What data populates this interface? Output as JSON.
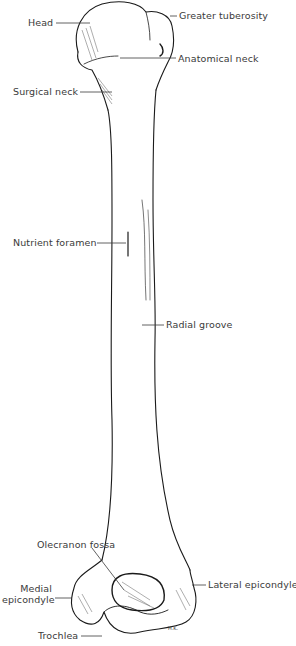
{
  "diagram": {
    "labels": {
      "head": "Head",
      "greater_tuberosity": "Greater tuberosity",
      "anatomical_neck": "Anatomical neck",
      "surgical_neck": "Surgical neck",
      "nutrient_foramen": "Nutrient foramen",
      "radial_groove": "Radial groove",
      "olecranon_fossa": "Olecranon fossa",
      "medial_epicondyle_1": "Medial",
      "medial_epicondyle_2": "epicondyle",
      "lateral_epicondyle": "Lateral epicondyle",
      "trochlea": "Trochlea"
    },
    "signature": "H.K.",
    "colors": {
      "ink": "#1a1a1a",
      "label": "#3a3a3a",
      "background": "#ffffff"
    }
  }
}
